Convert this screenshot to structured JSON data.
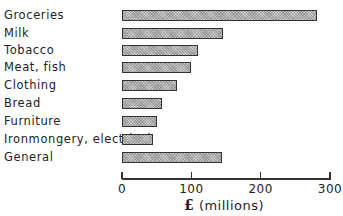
{
  "chart_data": {
    "type": "bar",
    "orientation": "horizontal",
    "title": "",
    "xlabel": "£ (millions)",
    "ylabel": "",
    "categories": [
      "Groceries",
      "Milk",
      "Tobacco",
      "Meat, fish",
      "Clothing",
      "Bread",
      "Furniture",
      "Ironmongery, electrical",
      "General"
    ],
    "values": [
      281,
      146,
      109,
      100,
      80,
      57,
      51,
      44,
      144
    ],
    "xlim": [
      0,
      300
    ],
    "xticks": [
      0,
      100,
      200,
      300
    ],
    "xtick_labels": [
      "0",
      "100",
      "200",
      "300"
    ],
    "grid": false,
    "legend": null,
    "bar_fill": "hatched grey"
  },
  "axis": {
    "unit_symbol": "£",
    "unit_text": " (millions)"
  }
}
